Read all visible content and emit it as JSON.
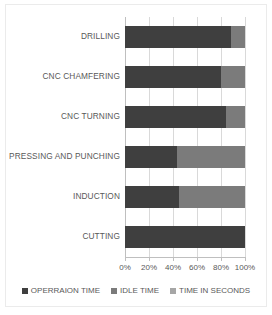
{
  "chart_data": {
    "type": "bar",
    "orientation": "horizontal",
    "stacked": true,
    "stack_mode": "percent",
    "title": "",
    "xlabel": "",
    "ylabel": "",
    "xlim": [
      0,
      100
    ],
    "xticks": [
      0,
      20,
      40,
      60,
      80,
      100
    ],
    "xtick_labels": [
      "0%",
      "20%",
      "40%",
      "60%",
      "80%",
      "100%"
    ],
    "grid": true,
    "legend_position": "bottom",
    "categories": [
      "DRILLING",
      "CNC CHAMFERING",
      "CNC TURNING",
      "PRESSING AND PUNCHING",
      "INDUCTION",
      "CUTTING"
    ],
    "series": [
      {
        "name": "OPERRAION TIME",
        "color": "#3f3f3f",
        "values": [
          88,
          80,
          84,
          43,
          45,
          100
        ]
      },
      {
        "name": "IDLE TIME",
        "color": "#7b7b7b",
        "values": [
          12,
          20,
          16,
          57,
          55,
          0
        ]
      },
      {
        "name": "TIME IN SECONDS",
        "color": "#a6a6a6",
        "values": [
          0,
          0,
          0,
          0,
          0,
          0
        ]
      }
    ]
  }
}
